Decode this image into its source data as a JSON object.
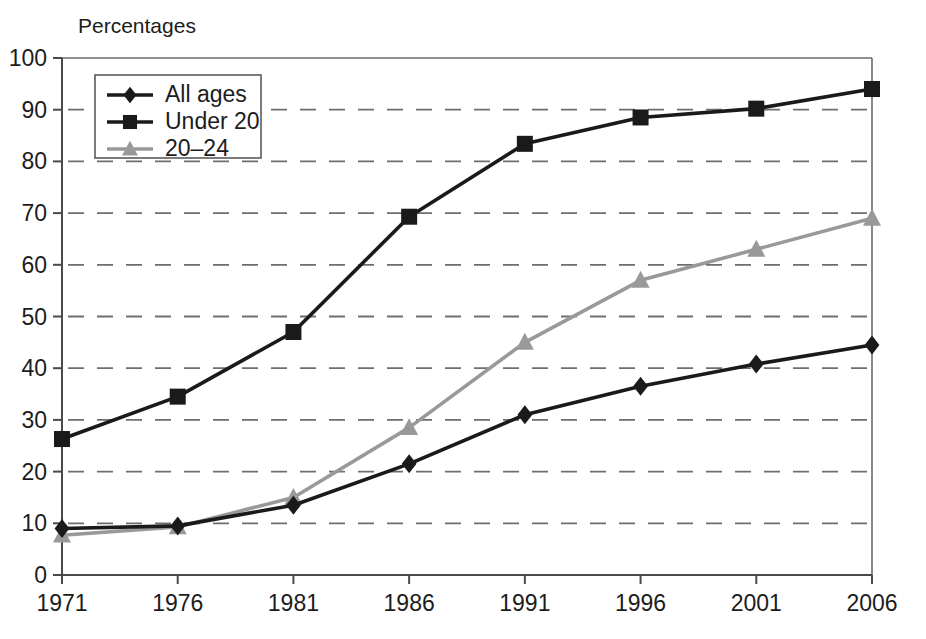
{
  "chart_data": {
    "type": "line",
    "title": "",
    "axis_note": "Percentages",
    "xlabel": "",
    "ylabel": "Percentages",
    "categories": [
      "1971",
      "1976",
      "1981",
      "1986",
      "1991",
      "1996",
      "2001",
      "2006"
    ],
    "x": [
      1971,
      1976,
      1981,
      1986,
      1991,
      1996,
      2001,
      2006
    ],
    "xtick_labels": [
      "1971",
      "1976",
      "1981",
      "1986",
      "1991",
      "1996",
      "2001",
      "2006"
    ],
    "ytick_labels": [
      "0",
      "10",
      "20",
      "30",
      "40",
      "50",
      "60",
      "70",
      "80",
      "90",
      "100"
    ],
    "yticks": [
      0,
      10,
      20,
      30,
      40,
      50,
      60,
      70,
      80,
      90,
      100
    ],
    "ylim": [
      0,
      100
    ],
    "grid": "horizontal-dashed",
    "legend_position": "top-left-inside",
    "series": [
      {
        "name": "All ages",
        "marker": "diamond",
        "color": "#1a1a1a",
        "values": [
          9.0,
          9.5,
          13.5,
          21.5,
          31.0,
          36.5,
          40.8,
          44.5
        ]
      },
      {
        "name": "Under 20",
        "marker": "square",
        "color": "#1a1a1a",
        "values": [
          26.3,
          34.5,
          47.0,
          69.3,
          83.4,
          88.5,
          90.2,
          94.0
        ]
      },
      {
        "name": "20–24",
        "marker": "triangle",
        "color": "#999999",
        "values": [
          7.7,
          9.3,
          15.0,
          28.5,
          45.0,
          57.0,
          63.0,
          69.0
        ]
      }
    ]
  },
  "legend": {
    "items": [
      {
        "label": "All ages"
      },
      {
        "label": "Under 20"
      },
      {
        "label": "20–24"
      }
    ]
  },
  "colors": {
    "black_series": "#1a1a1a",
    "gray_series": "#999999",
    "grid": "#6e6e6e",
    "axis": "#4a4a4a",
    "background": "#ffffff"
  }
}
